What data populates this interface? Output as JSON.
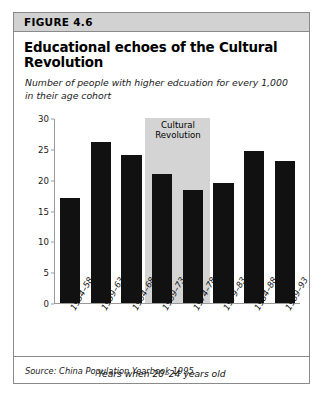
{
  "figure": {
    "number_label": "FIGURE 4.6",
    "title": "Educational echoes of the Cultural Revolution",
    "subtitle": "Number of people with higher edcuation for every 1,000 in their age cohort",
    "source": "Source: China Population Yearbook 1995.",
    "colors": {
      "header_band": "#d2d2d2",
      "frame_border": "#8a8a8a",
      "bar_fill": "#111111",
      "annotation_band": "#d4d4d4",
      "axis_line": "#9a9a9a"
    }
  },
  "chart_data": {
    "type": "bar",
    "title": "Educational echoes of the Cultural Revolution",
    "subtitle": "Number of people with higher edcuation for every 1,000 in their age cohort",
    "xlabel": "Years when 20–24 years old",
    "ylabel": "",
    "categories": [
      "1954–58",
      "1959–63",
      "1964–68",
      "1969–73",
      "1974–78",
      "1979–83",
      "1984–88",
      "1989–93"
    ],
    "values": [
      17,
      26.1,
      24,
      21,
      18.3,
      19.4,
      24.6,
      23
    ],
    "ylim": [
      0,
      30
    ],
    "yticks": [
      0,
      5,
      10,
      15,
      20,
      25,
      30
    ],
    "ytick_labels": [
      "0",
      "5",
      "10",
      "15",
      "20",
      "25",
      "30"
    ],
    "grid": false,
    "legend": "none",
    "annotations": [
      {
        "label": "Cultural Revolution",
        "label_line1": "Cultural",
        "label_line2": "Revolution",
        "type": "shaded-band",
        "spans_categories": [
          "1964–68",
          "1969–73"
        ]
      }
    ],
    "source": "Source: China Population Yearbook 1995."
  }
}
